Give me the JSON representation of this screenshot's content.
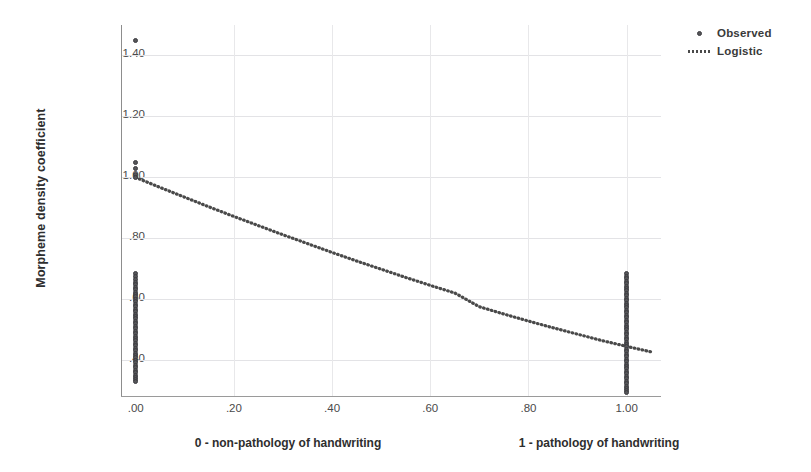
{
  "chart_data": {
    "type": "scatter",
    "title": "",
    "xlabel": "",
    "ylabel": "Morpheme density coefficient",
    "xlim": [
      -0.03,
      1.07
    ],
    "ylim": [
      0.28,
      1.5
    ],
    "grid": true,
    "legend_position": "top-right",
    "x_ticks": [
      0.0,
      0.2,
      0.4,
      0.6,
      0.8,
      1.0
    ],
    "x_tick_labels": [
      ".00",
      ".20",
      ".40",
      ".60",
      ".80",
      "1.00"
    ],
    "y_ticks": [
      0.4,
      0.6,
      0.8,
      1.0,
      1.2,
      1.4
    ],
    "y_tick_labels": [
      ".40",
      ".60",
      ".80",
      "1.00",
      "1.20",
      "1.40"
    ],
    "series": [
      {
        "name": "Observed",
        "type": "scatter",
        "marker": "circle",
        "color": "#555558",
        "points": [
          [
            0.0,
            1.45
          ],
          [
            0.0,
            1.05
          ],
          [
            0.0,
            1.03
          ],
          [
            0.0,
            1.01
          ],
          [
            0.0,
            1.0
          ],
          [
            0.0,
            0.685
          ],
          [
            0.0,
            0.675
          ],
          [
            0.0,
            0.665
          ],
          [
            0.0,
            0.655
          ],
          [
            0.0,
            0.648
          ],
          [
            0.0,
            0.64
          ],
          [
            0.0,
            0.632
          ],
          [
            0.0,
            0.624
          ],
          [
            0.0,
            0.616
          ],
          [
            0.0,
            0.608
          ],
          [
            0.0,
            0.6
          ],
          [
            0.0,
            0.592
          ],
          [
            0.0,
            0.584
          ],
          [
            0.0,
            0.576
          ],
          [
            0.0,
            0.568
          ],
          [
            0.0,
            0.56
          ],
          [
            0.0,
            0.552
          ],
          [
            0.0,
            0.544
          ],
          [
            0.0,
            0.536
          ],
          [
            0.0,
            0.528
          ],
          [
            0.0,
            0.52
          ],
          [
            0.0,
            0.512
          ],
          [
            0.0,
            0.504
          ],
          [
            0.0,
            0.496
          ],
          [
            0.0,
            0.488
          ],
          [
            0.0,
            0.48
          ],
          [
            0.0,
            0.472
          ],
          [
            0.0,
            0.464
          ],
          [
            0.0,
            0.456
          ],
          [
            0.0,
            0.448
          ],
          [
            0.0,
            0.44
          ],
          [
            0.0,
            0.432
          ],
          [
            0.0,
            0.424
          ],
          [
            0.0,
            0.416
          ],
          [
            0.0,
            0.408
          ],
          [
            0.0,
            0.4
          ],
          [
            0.0,
            0.392
          ],
          [
            0.0,
            0.384
          ],
          [
            0.0,
            0.376
          ],
          [
            0.0,
            0.368
          ],
          [
            0.0,
            0.36
          ],
          [
            0.0,
            0.352
          ],
          [
            0.0,
            0.344
          ],
          [
            0.0,
            0.336
          ],
          [
            0.0,
            0.33
          ],
          [
            1.0,
            0.685
          ],
          [
            1.0,
            0.675
          ],
          [
            1.0,
            0.668
          ],
          [
            1.0,
            0.66
          ],
          [
            1.0,
            0.652
          ],
          [
            1.0,
            0.644
          ],
          [
            1.0,
            0.636
          ],
          [
            1.0,
            0.628
          ],
          [
            1.0,
            0.62
          ],
          [
            1.0,
            0.612
          ],
          [
            1.0,
            0.604
          ],
          [
            1.0,
            0.596
          ],
          [
            1.0,
            0.588
          ],
          [
            1.0,
            0.58
          ],
          [
            1.0,
            0.572
          ],
          [
            1.0,
            0.564
          ],
          [
            1.0,
            0.556
          ],
          [
            1.0,
            0.548
          ],
          [
            1.0,
            0.54
          ],
          [
            1.0,
            0.532
          ],
          [
            1.0,
            0.524
          ],
          [
            1.0,
            0.516
          ],
          [
            1.0,
            0.508
          ],
          [
            1.0,
            0.5
          ],
          [
            1.0,
            0.492
          ],
          [
            1.0,
            0.484
          ],
          [
            1.0,
            0.476
          ],
          [
            1.0,
            0.468
          ],
          [
            1.0,
            0.46
          ],
          [
            1.0,
            0.452
          ],
          [
            1.0,
            0.444
          ],
          [
            1.0,
            0.436
          ],
          [
            1.0,
            0.428
          ],
          [
            1.0,
            0.42
          ],
          [
            1.0,
            0.412
          ],
          [
            1.0,
            0.404
          ],
          [
            1.0,
            0.396
          ],
          [
            1.0,
            0.388
          ],
          [
            1.0,
            0.38
          ],
          [
            1.0,
            0.372
          ],
          [
            1.0,
            0.364
          ],
          [
            1.0,
            0.356
          ],
          [
            1.0,
            0.348
          ],
          [
            1.0,
            0.34
          ],
          [
            1.0,
            0.332
          ],
          [
            1.0,
            0.324
          ],
          [
            1.0,
            0.316
          ],
          [
            1.0,
            0.308
          ],
          [
            1.0,
            0.3
          ],
          [
            1.0,
            0.295
          ]
        ]
      },
      {
        "name": "Logistic",
        "type": "line",
        "style": "dotted",
        "color": "#4a4a4a",
        "points": [
          [
            0.0,
            1.0
          ],
          [
            0.05,
            0.967
          ],
          [
            0.1,
            0.935
          ],
          [
            0.15,
            0.903
          ],
          [
            0.2,
            0.872
          ],
          [
            0.25,
            0.842
          ],
          [
            0.3,
            0.812
          ],
          [
            0.35,
            0.783
          ],
          [
            0.4,
            0.754
          ],
          [
            0.45,
            0.726
          ],
          [
            0.5,
            0.699
          ],
          [
            0.55,
            0.672
          ],
          [
            0.6,
            0.646
          ],
          [
            0.65,
            0.621
          ],
          [
            0.7,
            0.576
          ],
          [
            0.75,
            0.552
          ],
          [
            0.8,
            0.529
          ],
          [
            0.85,
            0.507
          ],
          [
            0.9,
            0.486
          ],
          [
            0.95,
            0.465
          ],
          [
            1.0,
            0.446
          ],
          [
            1.05,
            0.428
          ]
        ]
      }
    ],
    "annotations": [
      {
        "text": "0 - non-pathology of handwriting",
        "x": 0.12
      },
      {
        "text": "1 - pathology of handwriting",
        "x": 0.78
      }
    ]
  },
  "legend": {
    "items": [
      {
        "label": "Observed",
        "marker": "observed-dot-icon"
      },
      {
        "label": "Logistic",
        "marker": "logistic-dotted-line-icon"
      }
    ]
  }
}
